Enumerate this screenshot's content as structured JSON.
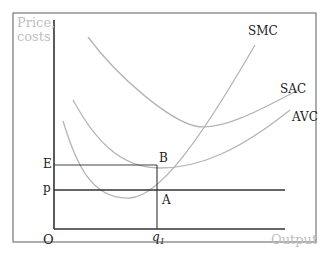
{
  "figure": {
    "axis_labels": {
      "y_line1": "Price,",
      "y_line2": "costs",
      "x": "Output",
      "origin": "O"
    },
    "curves": [
      {
        "name": "SMC",
        "label": "SMC"
      },
      {
        "name": "SAC",
        "label": "SAC"
      },
      {
        "name": "AVC",
        "label": "AVC"
      }
    ],
    "points": {
      "B": "B",
      "A": "A",
      "E": "E",
      "p": "p",
      "q1": "q",
      "q1_sub": "1"
    },
    "colors": {
      "axis": "#333333",
      "curve": "#b5b5b5",
      "frame": "#777777",
      "faint_text": "#c0c0c0",
      "text": "#222222"
    }
  }
}
